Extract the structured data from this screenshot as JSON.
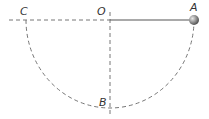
{
  "diagram": {
    "labels": {
      "A": "A",
      "B": "B",
      "C": "C",
      "O": "O"
    },
    "colors": {
      "line": "#555555",
      "dash": "#777777",
      "ball": "#888888"
    }
  }
}
